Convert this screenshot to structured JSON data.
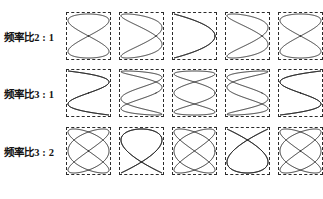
{
  "figure": {
    "stroke_color": "#1c1c1c",
    "box_border_color": "#2b2b2b",
    "background_color": "#ffffff",
    "columns": 5,
    "rows": 3
  },
  "rows": [
    {
      "label": "频率比2 : 1",
      "ratio_x": 2,
      "ratio_y": 1,
      "phases_deg": [
        0,
        45,
        90,
        135,
        180
      ]
    },
    {
      "label": "频率比3 : 1",
      "ratio_x": 3,
      "ratio_y": 1,
      "phases_deg": [
        0,
        45,
        90,
        135,
        180
      ]
    },
    {
      "label": "频率比3 : 2",
      "ratio_x": 3,
      "ratio_y": 2,
      "phases_deg": [
        0,
        45,
        90,
        135,
        180
      ]
    }
  ],
  "chart_data": {
    "type": "line",
    "xlabel": "",
    "ylabel": "",
    "grid": false,
    "legend": "none",
    "xlim": [
      -1,
      1
    ],
    "ylim": [
      -1,
      1
    ],
    "categories": [
      "0°",
      "45°",
      "90°",
      "135°",
      "180°"
    ],
    "series": [
      {
        "name": "频率比2 : 1",
        "ratio": "2:1",
        "fx": 2,
        "fy": 1,
        "phases_deg": [
          0,
          45,
          90,
          135,
          180
        ],
        "equation": "x = A sin(2wt + d), y = A sin(wt)"
      },
      {
        "name": "频率比3 : 1",
        "ratio": "3:1",
        "fx": 3,
        "fy": 1,
        "phases_deg": [
          0,
          45,
          90,
          135,
          180
        ],
        "equation": "x = A sin(3wt + d), y = A sin(wt)"
      },
      {
        "name": "频率比3 : 2",
        "ratio": "3:2",
        "fx": 3,
        "fy": 2,
        "phases_deg": [
          0,
          45,
          90,
          135,
          180
        ],
        "equation": "x = A sin(3wt + d), y = A sin(2wt)"
      }
    ]
  }
}
